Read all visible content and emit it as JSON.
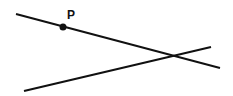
{
  "diagram": {
    "point": {
      "label": "P",
      "x": 63,
      "y": 27
    },
    "lines": [
      {
        "name": "line-through-p",
        "x1": 16,
        "y1": 14,
        "x2": 220,
        "y2": 68
      },
      {
        "name": "second-line",
        "x1": 24,
        "y1": 91,
        "x2": 211,
        "y2": 47
      }
    ],
    "colors": {
      "stroke": "#111111",
      "background": "#ffffff"
    }
  }
}
